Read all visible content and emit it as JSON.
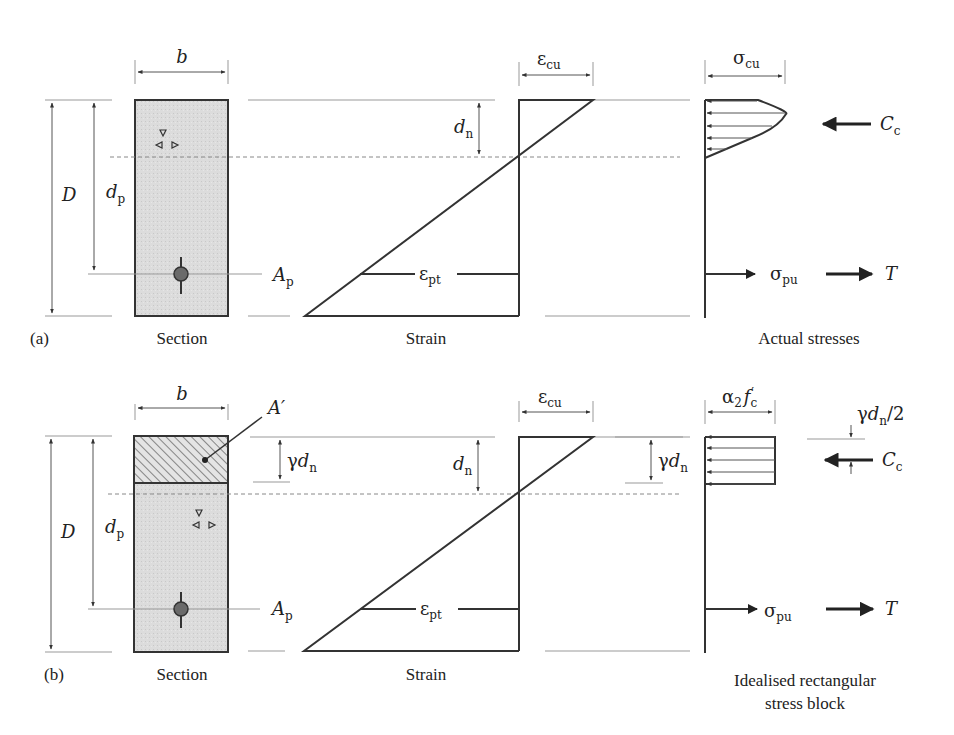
{
  "figure": {
    "panel_a": {
      "tag": "(a)",
      "section": {
        "caption": "Section",
        "width_label": "b",
        "depth_label": "D",
        "dp_label": "d",
        "dp_sub": "p",
        "tendon_label": "A",
        "tendon_sub": "p"
      },
      "strain": {
        "caption": "Strain",
        "top_label": "ε",
        "top_sub": "cu",
        "dn_label": "d",
        "dn_sub": "n",
        "tendon_label": "ε",
        "tendon_sub": "pt"
      },
      "stress": {
        "caption": "Actual stresses",
        "top_label": "σ",
        "top_sub": "cu",
        "compression_label": "C",
        "compression_sub": "c",
        "tendon_stress_label": "σ",
        "tendon_stress_sub": "pu",
        "tension_label": "T"
      }
    },
    "panel_b": {
      "tag": "(b)",
      "section": {
        "caption": "Section",
        "width_label": "b",
        "depth_label": "D",
        "dp_label": "d",
        "dp_sub": "p",
        "tendon_label": "A",
        "tendon_sub": "p",
        "area_label": "A′",
        "gdn_gamma": "γ",
        "gdn_label": "d",
        "gdn_sub": "n"
      },
      "strain": {
        "caption": "Strain",
        "top_label": "ε",
        "top_sub": "cu",
        "dn_label": "d",
        "dn_sub": "n",
        "tendon_label": "ε",
        "tendon_sub": "pt"
      },
      "stress": {
        "caption_line1": "Idealised rectangular",
        "caption_line2": "stress block",
        "top_alpha": "α",
        "top_alpha_sub": "2",
        "top_f": "f",
        "top_f_sub": "c",
        "top_f_prime": "′",
        "gdn_gamma": "γ",
        "gdn_label": "d",
        "gdn_sub": "n",
        "half_gamma": "γ",
        "half_d": "d",
        "half_sub": "n",
        "half_tail": "/2",
        "compression_label": "C",
        "compression_sub": "c",
        "tendon_stress_label": "σ",
        "tendon_stress_sub": "pu",
        "tension_label": "T"
      }
    },
    "colors": {
      "concrete_fill": "#d9d9d9",
      "line": "#333333",
      "guide": "#999999",
      "tendon": "#666666"
    }
  }
}
